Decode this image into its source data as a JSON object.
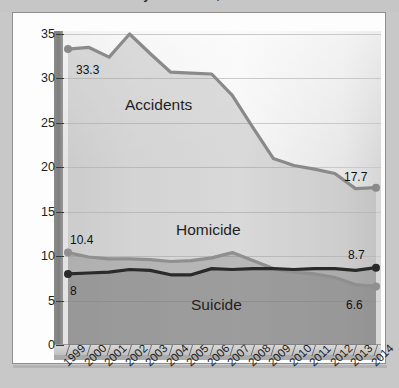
{
  "page": {
    "title_partial": "Rates of death by accidents, homicide and suicide",
    "background_color": "#c8c8c8",
    "card_color": "#fdfdfd"
  },
  "chart_data": {
    "type": "line",
    "title": "Rates of death by accidents, homicide and suicide",
    "xlabel": "",
    "ylabel": "",
    "ylim": [
      0,
      37
    ],
    "yticks": [
      "0",
      "5",
      "10",
      "15",
      "20",
      "25",
      "30",
      "35"
    ],
    "ytick_values": [
      0,
      5,
      10,
      15,
      20,
      25,
      30,
      35
    ],
    "grid": true,
    "legend_position": "inline-annotations",
    "categories": [
      "1999",
      "2000",
      "2001",
      "2002",
      "2003",
      "2004",
      "2005",
      "2006",
      "2007",
      "2008",
      "2009",
      "2010",
      "2011",
      "2012",
      "2013",
      "2014"
    ],
    "series": [
      {
        "name": "Accidents",
        "color": "#8a8a8a",
        "values": [
          33.3,
          33.5,
          32.4,
          35.0,
          32.8,
          30.7,
          30.6,
          30.5,
          28.1,
          24.5,
          21.0,
          20.2,
          19.8,
          19.3,
          17.6,
          17.7
        ],
        "start_label": "33.3",
        "end_label": "17.7"
      },
      {
        "name": "Homicide",
        "color": "#8f8f8f",
        "values": [
          10.4,
          9.9,
          9.7,
          9.7,
          9.6,
          9.4,
          9.5,
          9.8,
          10.4,
          9.5,
          8.6,
          8.2,
          8.0,
          7.6,
          6.8,
          6.6
        ],
        "start_label": "10.4",
        "end_label": "6.6"
      },
      {
        "name": "Suicide",
        "color": "#2a2a2a",
        "values": [
          8.0,
          8.1,
          8.2,
          8.5,
          8.4,
          7.9,
          7.9,
          8.6,
          8.5,
          8.6,
          8.6,
          8.5,
          8.6,
          8.6,
          8.4,
          8.7
        ],
        "start_label": "8",
        "end_label": "8.7"
      }
    ],
    "annotations": [
      {
        "text": "Accidents",
        "series": "Accidents"
      },
      {
        "text": "Homicide",
        "series": "Homicide"
      },
      {
        "text": "Suicide",
        "series": "Suicide"
      }
    ]
  }
}
